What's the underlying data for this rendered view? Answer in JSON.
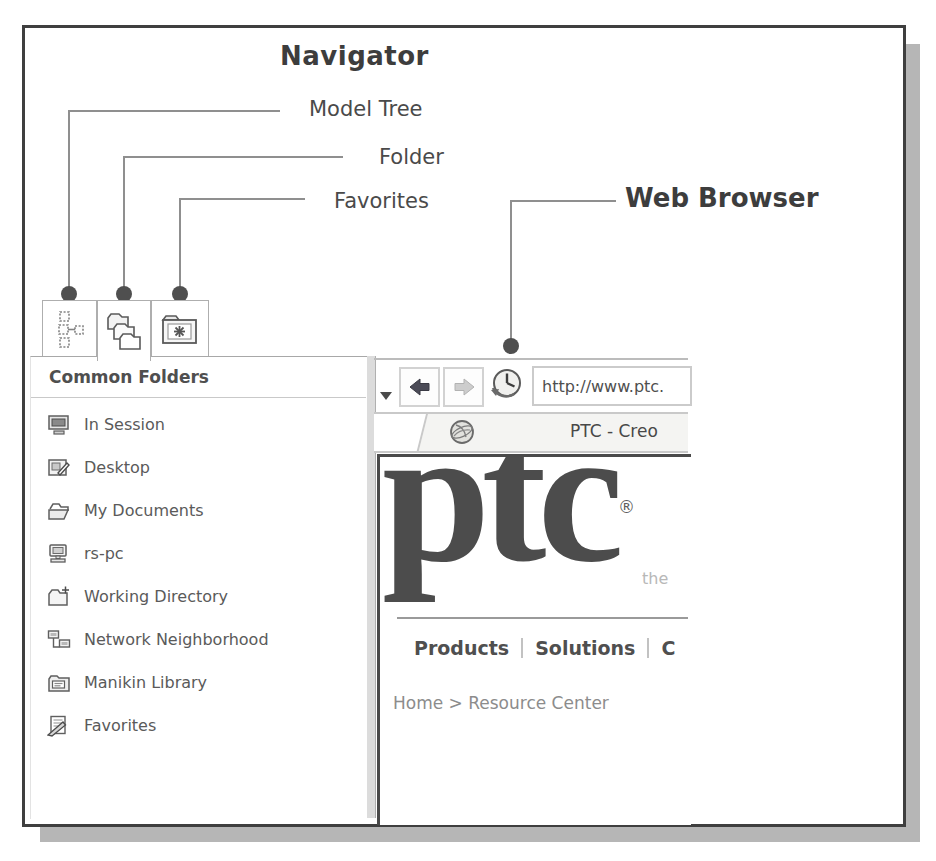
{
  "figure": {
    "title": "Navigator",
    "callouts": {
      "model_tree": "Model Tree",
      "folder": "Folder",
      "favorites": "Favorites",
      "web_browser": "Web Browser"
    }
  },
  "navigator": {
    "tabs": [
      {
        "name": "Model Tree",
        "icon": "model-tree-icon",
        "selected": false
      },
      {
        "name": "Folder",
        "icon": "folder-stack-icon",
        "selected": true
      },
      {
        "name": "Favorites",
        "icon": "favorites-folder-icon",
        "selected": false
      }
    ],
    "panel_title": "Common Folders",
    "folders": [
      {
        "label": "In Session",
        "icon": "in-session-icon"
      },
      {
        "label": "Desktop",
        "icon": "desktop-icon"
      },
      {
        "label": "My Documents",
        "icon": "my-documents-icon"
      },
      {
        "label": "rs-pc",
        "icon": "computer-icon"
      },
      {
        "label": "Working Directory",
        "icon": "working-directory-icon"
      },
      {
        "label": "Network Neighborhood",
        "icon": "network-neighborhood-icon"
      },
      {
        "label": "Manikin Library",
        "icon": "manikin-library-icon"
      },
      {
        "label": "Favorites",
        "icon": "favorites-item-icon"
      }
    ]
  },
  "browser": {
    "toolbar": {
      "url_value": "http://www.ptc."
    },
    "tab_title": "PTC - Creo",
    "page": {
      "logo_text": "PTC",
      "registered_mark": "®",
      "tagline_fragment": "the",
      "menu": [
        "Products",
        "Solutions",
        "C"
      ],
      "breadcrumb": "Home > Resource Center"
    }
  },
  "colors": {
    "frame_border": "#3f3f3f",
    "drop_shadow": "#b6b6b6",
    "callout_line": "#8f8f8f",
    "callout_dot": "#4f4f4f",
    "text_dark": "#3d3d3d",
    "text_medium": "#5a5a5a",
    "text_light": "#b8b8b8",
    "tab_border": "#aeaeae",
    "content_border": "#4a4a4a"
  }
}
